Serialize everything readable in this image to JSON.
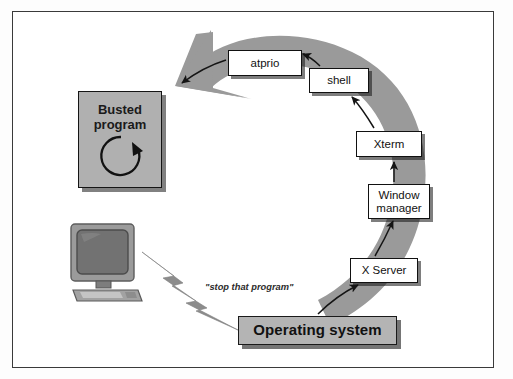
{
  "diagram": {
    "title_present": false,
    "type": "cycle-flow-diagram",
    "colors": {
      "arc_gray": "#9a9a9a",
      "box_fill": "#ffffff",
      "os_box_fill": "#b4b4b4",
      "busted_box_fill": "#b0b0b0",
      "stroke": "#111111",
      "frame": "#3a3a3a",
      "monitor_gray": "#8e8e8e",
      "bolt_gray": "#8c8c8c"
    },
    "nodes": [
      {
        "id": "busted",
        "label_line1": "Busted",
        "label_line2": "program",
        "name": "busted-program-box",
        "icon": "circular-arrow-loop-icon"
      },
      {
        "id": "atprio",
        "label": "atprio",
        "name": "atprio-box"
      },
      {
        "id": "shell",
        "label": "shell",
        "name": "shell-box"
      },
      {
        "id": "xterm",
        "label": "Xterm",
        "name": "xterm-box"
      },
      {
        "id": "wm",
        "label_line1": "Window",
        "label_line2": "manager",
        "name": "window-manager-box"
      },
      {
        "id": "xserver",
        "label": "X Server",
        "name": "x-server-box"
      },
      {
        "id": "os",
        "label": "Operating system",
        "name": "operating-system-box"
      }
    ],
    "edges": [
      {
        "from": "os",
        "to": "xserver",
        "style": "thin-curved-arrow"
      },
      {
        "from": "xserver",
        "to": "wm",
        "style": "thin-curved-arrow"
      },
      {
        "from": "wm",
        "to": "xterm",
        "style": "thin-curved-arrow"
      },
      {
        "from": "xterm",
        "to": "shell",
        "style": "thin-curved-arrow"
      },
      {
        "from": "shell",
        "to": "atprio",
        "style": "thin-curved-arrow"
      },
      {
        "from": "atprio",
        "to": "busted",
        "style": "thin-curved-arrow"
      },
      {
        "from": "monitor",
        "to": "os",
        "style": "gray-lightning-bolt",
        "label": "\"stop that program\""
      }
    ],
    "big_arrow": {
      "name": "gray-cycle-arrow",
      "description": "thick counter-clockwise gray arc arrow ending in arrowhead pointing left toward Busted program"
    },
    "annotations": {
      "stop_that_program": "\"stop that program\""
    },
    "illustration": {
      "name": "desktop-computer-illustration",
      "parts": [
        "crt-monitor",
        "monitor-stand",
        "keyboard"
      ]
    }
  }
}
